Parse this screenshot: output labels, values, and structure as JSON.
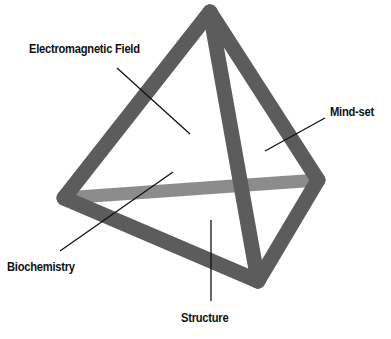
{
  "diagram": {
    "type": "tetrahedron",
    "labels": {
      "top_left": "Electromagnetic Field",
      "right": "Mind-set",
      "bottom_left": "Biochemistry",
      "bottom": "Structure"
    },
    "colors": {
      "edge_front": "#5a5a5a",
      "edge_back": "#8a8a8a",
      "leader_line": "#111111",
      "background": "#ffffff"
    }
  }
}
